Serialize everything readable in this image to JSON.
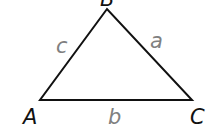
{
  "diagram": {
    "type": "triangle",
    "vertices": [
      {
        "id": "A",
        "label": "A"
      },
      {
        "id": "B",
        "label": "B"
      },
      {
        "id": "C",
        "label": "C"
      }
    ],
    "sides": [
      {
        "id": "a",
        "label": "a",
        "between": [
          "B",
          "C"
        ]
      },
      {
        "id": "b",
        "label": "b",
        "between": [
          "A",
          "C"
        ]
      },
      {
        "id": "c",
        "label": "c",
        "between": [
          "A",
          "B"
        ]
      }
    ],
    "colors": {
      "edge": "#111111",
      "vertex_label": "#111111",
      "side_label": "#808080"
    }
  }
}
